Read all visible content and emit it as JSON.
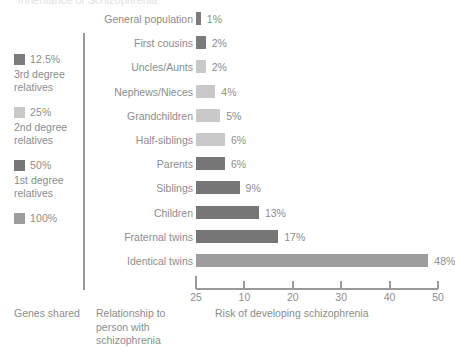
{
  "top_clipped_text": "Inheritance of Schizophrenia",
  "colors": {
    "shade_3rd_degree": "#7b7b7b",
    "shade_2nd_degree": "#c9c9c9",
    "shade_1st_degree": "#767676",
    "shade_100": "#9d9d9d",
    "axis": "#9a9a9a",
    "text": "#8d8d8d"
  },
  "legend": {
    "groups": [
      {
        "pct": "12.5%",
        "sub_line1": "3rd degree",
        "sub_line2": "relatives",
        "swatch": "shade_3rd_degree"
      },
      {
        "pct": "25%",
        "sub_line1": "2nd degree",
        "sub_line2": "relatives",
        "swatch": "shade_2nd_degree"
      },
      {
        "pct": "50%",
        "sub_line1": "1st degree",
        "sub_line2": "relatives",
        "swatch": "shade_1st_degree"
      },
      {
        "pct": "100%",
        "sub_line1": "",
        "sub_line2": "",
        "swatch": "shade_100"
      }
    ]
  },
  "captions": {
    "genes_shared": "Genes shared",
    "relationship_line1": "Relationship to",
    "relationship_line2": "person with",
    "relationship_line3": "schizophrenia"
  },
  "chart_data": {
    "type": "bar",
    "orientation": "horizontal",
    "title": "",
    "xlabel": "Risk of developing schizophrenia",
    "ylabel": "",
    "grid": false,
    "legend_position": "left",
    "xlim": [
      0,
      50
    ],
    "xticks": [
      "25",
      "10",
      "20",
      "30",
      "40",
      "50"
    ],
    "xtick_values": [
      0,
      10,
      20,
      30,
      40,
      50
    ],
    "categories": [
      "General population",
      "First cousins",
      "Uncles/Aunts",
      "Nephews/Nieces",
      "Grandchildren",
      "Half-siblings",
      "Parents",
      "Siblings",
      "Children",
      "Fraternal twins",
      "Identical twins"
    ],
    "values": [
      1,
      2,
      2,
      4,
      5,
      6,
      6,
      9,
      13,
      17,
      48
    ],
    "value_labels": [
      "1%",
      "2%",
      "2%",
      "4%",
      "5%",
      "6%",
      "6%",
      "9%",
      "13%",
      "17%",
      "48%"
    ],
    "bar_groups": [
      "shade_3rd_degree",
      "shade_3rd_degree",
      "shade_2nd_degree",
      "shade_2nd_degree",
      "shade_2nd_degree",
      "shade_2nd_degree",
      "shade_1st_degree",
      "shade_1st_degree",
      "shade_1st_degree",
      "shade_1st_degree",
      "shade_100"
    ]
  }
}
